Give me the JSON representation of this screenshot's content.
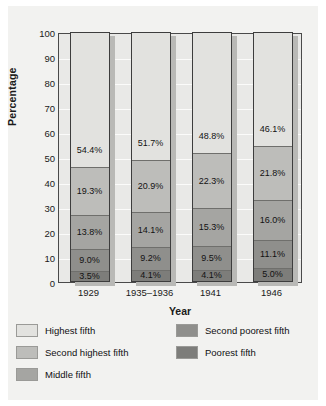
{
  "chart_data": {
    "type": "bar",
    "subtype": "stacked-100-percent",
    "title": "",
    "xlabel": "Year",
    "ylabel": "Percentage",
    "ylim": [
      0,
      100
    ],
    "ytick_step": 10,
    "yticks": [
      "100",
      "90",
      "80",
      "70",
      "60",
      "50",
      "40",
      "30",
      "20",
      "10",
      "0"
    ],
    "grid": true,
    "grid_orientation": "horizontal",
    "legend_position": "bottom",
    "categories": [
      "1929",
      "1935–1936",
      "1941",
      "1946"
    ],
    "series": [
      {
        "name": "Poorest fifth",
        "color": "#7d7d7a",
        "values": [
          3.5,
          4.1,
          4.1,
          5.0
        ],
        "labels": [
          "3.5%",
          "4.1%",
          "4.1%",
          "5.0%"
        ]
      },
      {
        "name": "Second poorest fifth",
        "color": "#8f8f8c",
        "values": [
          9.0,
          9.2,
          9.5,
          11.1
        ],
        "labels": [
          "9.0%",
          "9.2%",
          "9.5%",
          "11.1%"
        ]
      },
      {
        "name": "Middle fifth",
        "color": "#a5a5a2",
        "values": [
          13.8,
          14.1,
          15.3,
          16.0
        ],
        "labels": [
          "13.8%",
          "14.1%",
          "15.3%",
          "16.0%"
        ]
      },
      {
        "name": "Second highest fifth",
        "color": "#bdbdba",
        "values": [
          19.3,
          20.9,
          22.3,
          21.8
        ],
        "labels": [
          "19.3%",
          "20.9%",
          "22.3%",
          "21.8%"
        ]
      },
      {
        "name": "Highest fifth",
        "color": "#e2e2df",
        "values": [
          54.4,
          51.7,
          48.8,
          46.1
        ],
        "labels": [
          "54.4%",
          "51.7%",
          "48.8%",
          "46.1%"
        ]
      }
    ]
  },
  "legend": {
    "left_column": [
      {
        "label": "Highest fifth",
        "color": "#e2e2df"
      },
      {
        "label": "Second highest fifth",
        "color": "#bdbdba"
      },
      {
        "label": "Middle fifth",
        "color": "#a5a5a2"
      }
    ],
    "right_column": [
      {
        "label": "Second poorest fifth",
        "color": "#8f8f8c"
      },
      {
        "label": "Poorest fifth",
        "color": "#7d7d7a"
      }
    ]
  },
  "colors": {
    "figure_background": "#f2f2f0",
    "plot_background": "#e9e9e7",
    "axis_line": "#4a4a4a",
    "gridline": "#fbfbfa",
    "text": "#1a1a1a",
    "bar_shadow": "#b9b9b6"
  }
}
